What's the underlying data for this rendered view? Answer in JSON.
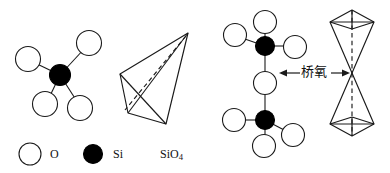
{
  "figure": {
    "width": 390,
    "height": 173,
    "background": "#ffffff",
    "stroke_color": "#1a1a1a",
    "atom_fill_o": "#ffffff",
    "atom_fill_si": "#000000"
  },
  "panels": {
    "left_ball_stick": {
      "name": "SiO4 ball-and-stick model",
      "center_atom": "Si",
      "ligand_atom": "O",
      "ligand_count": 4
    },
    "left_polyhedron": {
      "name": "SiO4 tetrahedron",
      "vertices": 4,
      "hidden_edge_style": "dashed"
    },
    "right_ball_stick": {
      "name": "Two corner-sharing SiO4 units",
      "si_count": 2,
      "bridging_o_count": 1,
      "terminal_o_count": 6
    },
    "right_polyhedron": {
      "name": "Two corner-sharing tetrahedra",
      "tetrahedra": 2,
      "shared_vertex": 1,
      "axis_style": "dashed"
    }
  },
  "annotation": {
    "bridging_oxygen_label": "桥氧",
    "left_arrow": "←",
    "right_arrow": "→"
  },
  "legend": {
    "items": [
      {
        "marker": "open-circle",
        "symbol": "O",
        "symbol_sub": ""
      },
      {
        "marker": "filled-circle",
        "symbol": "Si",
        "symbol_sub": ""
      },
      {
        "marker": "none",
        "symbol": "SiO",
        "symbol_sub": "4"
      }
    ]
  }
}
